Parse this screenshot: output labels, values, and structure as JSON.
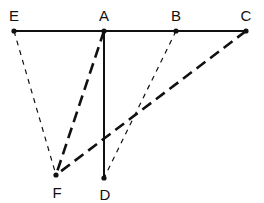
{
  "figure": {
    "kind": "geometric-line-diagram",
    "width": 264,
    "height": 203,
    "background_color": "#ffffff",
    "stroke_color": "#111111"
  },
  "points": [
    {
      "id": "E",
      "label": "E",
      "x": 14,
      "y": 31,
      "label_x": 14,
      "label_y": 21,
      "dot": true
    },
    {
      "id": "A",
      "label": "A",
      "x": 104,
      "y": 31,
      "label_x": 104,
      "label_y": 21,
      "dot": true
    },
    {
      "id": "B",
      "label": "B",
      "x": 176,
      "y": 31,
      "label_x": 176,
      "label_y": 21,
      "dot": true
    },
    {
      "id": "C",
      "label": "C",
      "x": 246,
      "y": 31,
      "label_x": 246,
      "label_y": 21,
      "dot": true
    },
    {
      "id": "F",
      "label": "F",
      "x": 56,
      "y": 175,
      "label_x": 57,
      "label_y": 198,
      "dot": true
    },
    {
      "id": "D",
      "label": "D",
      "x": 104,
      "y": 178,
      "label_x": 105,
      "label_y": 200,
      "dot": true
    }
  ],
  "segments": [
    {
      "id": "EC",
      "from": "E",
      "to": "C",
      "style": "solid",
      "weight": "medium",
      "x1": 14,
      "y1": 31,
      "x2": 246,
      "y2": 31
    },
    {
      "id": "AD",
      "from": "A",
      "to": "D",
      "style": "solid",
      "weight": "medium",
      "x1": 104,
      "y1": 31,
      "x2": 104,
      "y2": 178
    },
    {
      "id": "EF",
      "from": "E",
      "to": "F",
      "style": "dashed",
      "weight": "thin",
      "x1": 14,
      "y1": 31,
      "x2": 56,
      "y2": 175
    },
    {
      "id": "BD",
      "from": "B",
      "to": "D",
      "style": "dashed",
      "weight": "thin",
      "x1": 176,
      "y1": 31,
      "x2": 104,
      "y2": 178
    },
    {
      "id": "AF",
      "from": "A",
      "to": "F",
      "style": "dashed",
      "weight": "thick",
      "x1": 104,
      "y1": 31,
      "x2": 56,
      "y2": 175
    },
    {
      "id": "CF",
      "from": "C",
      "to": "F",
      "style": "dashed",
      "weight": "thick",
      "x1": 246,
      "y1": 31,
      "x2": 56,
      "y2": 175
    }
  ],
  "labels": {
    "E": "E",
    "A": "A",
    "B": "B",
    "C": "C",
    "D": "D",
    "F": "F"
  }
}
